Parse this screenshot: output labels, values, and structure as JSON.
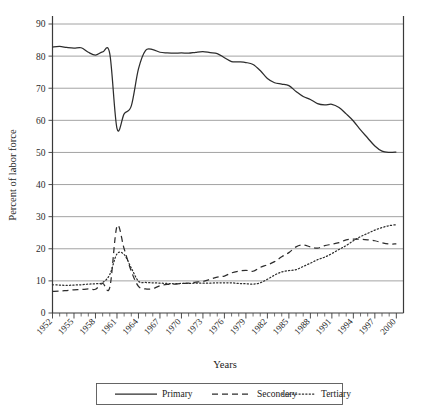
{
  "chart_data": {
    "type": "line",
    "title": "",
    "xlabel": "Years",
    "ylabel": "Percent of labor force",
    "xlim": [
      1952,
      2001
    ],
    "ylim": [
      0,
      92
    ],
    "yticks": [
      0,
      10,
      20,
      30,
      40,
      50,
      60,
      70,
      80,
      90
    ],
    "xticks": [
      1952,
      1955,
      1958,
      1961,
      1964,
      1967,
      1970,
      1973,
      1976,
      1979,
      1982,
      1985,
      1988,
      1991,
      1994,
      1997,
      2000
    ],
    "xtick_labels": [
      "1952",
      "1955",
      "1958",
      "1961",
      "1964",
      "1967",
      "1970",
      "1973",
      "1976",
      "1979",
      "1982",
      "1985",
      "1988",
      "1991",
      "1994",
      "1997",
      "2000"
    ],
    "grid": "horizontal",
    "legend_position": "bottom",
    "x": [
      1952,
      1953,
      1954,
      1955,
      1956,
      1957,
      1958,
      1959,
      1960,
      1961,
      1962,
      1963,
      1964,
      1965,
      1966,
      1967,
      1968,
      1969,
      1970,
      1971,
      1972,
      1973,
      1974,
      1975,
      1976,
      1977,
      1978,
      1979,
      1980,
      1981,
      1982,
      1983,
      1984,
      1985,
      1986,
      1987,
      1988,
      1989,
      1990,
      1991,
      1992,
      1993,
      1994,
      1995,
      1996,
      1997,
      1998,
      1999,
      2000
    ],
    "series": [
      {
        "name": "Primary",
        "style": "solid",
        "values": [
          82.8,
          83.0,
          82.7,
          82.5,
          82.6,
          81.2,
          80.3,
          81.3,
          80.7,
          57.5,
          62.0,
          64.5,
          76.0,
          81.8,
          82.0,
          81.2,
          81.0,
          80.9,
          81.0,
          80.9,
          81.2,
          81.4,
          81.1,
          80.8,
          79.5,
          78.3,
          78.2,
          78.0,
          77.4,
          75.5,
          73.0,
          71.7,
          71.3,
          70.8,
          69.0,
          67.4,
          66.5,
          65.2,
          64.8,
          65.0,
          64.0,
          62.0,
          59.8,
          57.0,
          54.5,
          52.0,
          50.4,
          50.0,
          50.1
        ]
      },
      {
        "name": "Secondary",
        "style": "dashed",
        "values": [
          6.7,
          6.8,
          7.0,
          7.2,
          7.3,
          7.5,
          7.4,
          9.2,
          8.0,
          27.0,
          20.0,
          13.0,
          8.3,
          7.5,
          7.6,
          8.5,
          8.9,
          9.0,
          9.2,
          9.3,
          9.6,
          9.8,
          10.5,
          11.2,
          11.5,
          12.5,
          13.0,
          13.3,
          13.0,
          14.2,
          15.0,
          16.0,
          17.5,
          18.8,
          20.6,
          21.2,
          20.6,
          20.2,
          21.0,
          21.4,
          21.9,
          22.8,
          23.0,
          23.0,
          22.8,
          22.5,
          21.9,
          21.5,
          21.5
        ]
      },
      {
        "name": "Tertiary",
        "style": "dotted",
        "values": [
          8.8,
          8.7,
          8.6,
          8.7,
          8.8,
          9.0,
          9.1,
          9.5,
          12.0,
          18.4,
          18.2,
          14.0,
          9.9,
          9.5,
          9.4,
          9.3,
          9.2,
          9.1,
          9.2,
          9.2,
          9.3,
          9.3,
          9.3,
          9.4,
          9.4,
          9.4,
          9.2,
          9.1,
          9.0,
          9.4,
          10.5,
          11.8,
          12.8,
          13.2,
          13.5,
          14.5,
          15.5,
          16.6,
          17.4,
          18.5,
          19.8,
          21.0,
          22.5,
          23.8,
          24.8,
          25.8,
          26.6,
          27.2,
          27.5
        ]
      }
    ],
    "legend": [
      {
        "label": "Primary",
        "style": "solid"
      },
      {
        "label": "Secondary",
        "style": "dashed"
      },
      {
        "label": "Tertiary",
        "style": "dotted"
      }
    ]
  }
}
